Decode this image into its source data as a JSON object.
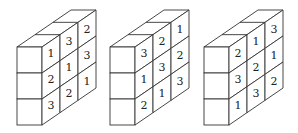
{
  "figures": [
    {
      "name": "block-1",
      "side_face_numbers": [
        [
          "1",
          "3",
          "2"
        ],
        [
          "2",
          "1",
          "3"
        ],
        [
          "3",
          "2",
          "1"
        ]
      ]
    },
    {
      "name": "block-2",
      "side_face_numbers": [
        [
          "3",
          "2",
          "1"
        ],
        [
          "1",
          "3",
          "2"
        ],
        [
          "2",
          "1",
          "3"
        ]
      ]
    },
    {
      "name": "block-3",
      "side_face_numbers": [
        [
          "2",
          "1",
          "3"
        ],
        [
          "3",
          "2",
          "1"
        ],
        [
          "1",
          "3",
          "2"
        ]
      ]
    }
  ],
  "colors": {
    "line": "#333333",
    "background": "#ffffff",
    "text": "#222222"
  }
}
